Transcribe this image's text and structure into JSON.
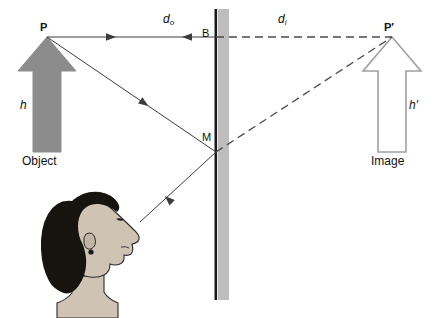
{
  "figure": {
    "type": "optics-ray-diagram",
    "canvas": {
      "width": 437,
      "height": 318,
      "background": "#ffffff"
    },
    "colors": {
      "object_arrow_fill": "#8c8c8c",
      "object_arrow_stroke": "#8c8c8c",
      "image_arrow_fill": "#ffffff",
      "image_arrow_stroke": "#a0a0a0",
      "mirror_surface": "#1a1a1a",
      "mirror_glass": "#bdbdbd",
      "ray_solid": "#3c3c3c",
      "ray_dashed": "#4a4a4a",
      "hair": "#17140f",
      "skin": "#cfc4b4",
      "skin_outline": "#2a2a2a",
      "text": "#111111"
    }
  },
  "labels": {
    "object_point": "P",
    "image_point": "P′",
    "mirror_top_point": "B",
    "mirror_reflect_point": "M",
    "object_distance": "d",
    "object_distance_sub": "o",
    "image_distance": "d",
    "image_distance_sub": "i",
    "object_height": "h",
    "image_height": "h′",
    "object_caption": "Object",
    "image_caption": "Image"
  },
  "elements": {
    "mirror": {
      "name": "plane-mirror",
      "surface_x": 216,
      "glass_x": 218,
      "glass_width": 11,
      "top_y": 9,
      "bottom_y": 300
    },
    "object_arrow": {
      "name": "object-arrow",
      "tip_x": 47,
      "tip_y": 37,
      "base_y": 152,
      "shaft_half_width": 14,
      "head_half_width": 29,
      "head_height": 34
    },
    "image_arrow": {
      "name": "image-arrow",
      "tip_x": 392,
      "tip_y": 37,
      "base_y": 152,
      "shaft_half_width": 14,
      "head_half_width": 29,
      "head_height": 34
    },
    "observer_head": {
      "name": "observer-head",
      "eye_x": 140,
      "eye_y": 222,
      "facing": "right"
    },
    "rays": [
      {
        "name": "ray-P-to-B-incident",
        "style": "solid",
        "from": [
          47,
          37
        ],
        "to": [
          216,
          37
        ],
        "arrow_at": [
          113,
          37
        ],
        "arrow_dir": "right"
      },
      {
        "name": "ray-B-reflected-back",
        "style": "solid",
        "from": [
          216,
          37
        ],
        "to": [
          47,
          37
        ],
        "arrow_at": [
          185,
          37
        ],
        "arrow_dir": "left"
      },
      {
        "name": "ray-P-to-M-incident",
        "style": "solid",
        "from": [
          47,
          37
        ],
        "to": [
          216,
          152
        ],
        "arrow_at": [
          145,
          123
        ],
        "arrow_dir": "down-right"
      },
      {
        "name": "ray-M-to-eye-reflected",
        "style": "solid",
        "from": [
          216,
          152
        ],
        "to": [
          140,
          222
        ],
        "arrow_at": [
          163,
          201
        ],
        "arrow_dir": "down-left"
      },
      {
        "name": "virtual-ray-B-to-Pprime",
        "style": "dashed",
        "from": [
          216,
          37
        ],
        "to": [
          392,
          37
        ]
      },
      {
        "name": "virtual-ray-M-to-Pprime",
        "style": "dashed",
        "from": [
          216,
          152
        ],
        "to": [
          392,
          37
        ]
      }
    ],
    "label_positions": {
      "object_point": [
        40,
        22
      ],
      "image_point": [
        384,
        22
      ],
      "mirror_top_point": [
        202,
        28
      ],
      "mirror_reflect_point": [
        202,
        132
      ],
      "object_distance": [
        163,
        14
      ],
      "image_distance": [
        278,
        14
      ],
      "object_height": [
        20,
        100
      ],
      "image_height": [
        409,
        100
      ],
      "object_caption": [
        22,
        155
      ],
      "image_caption": [
        371,
        155
      ]
    }
  }
}
